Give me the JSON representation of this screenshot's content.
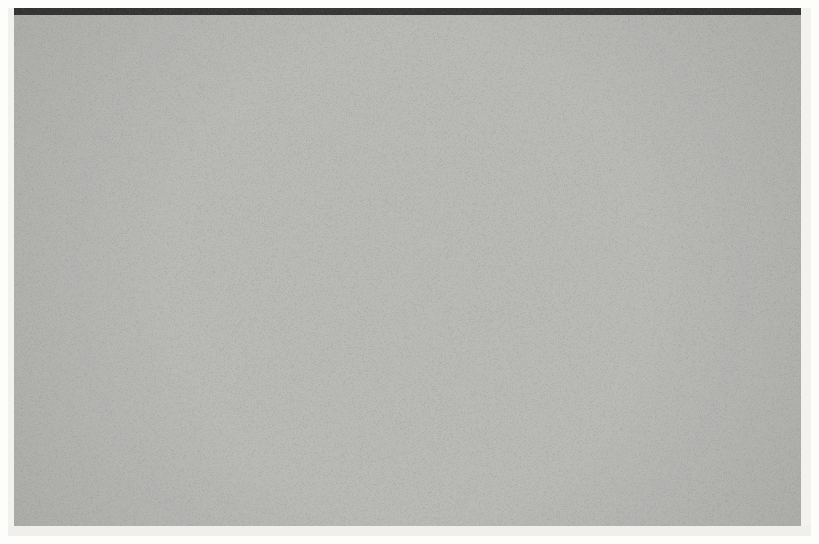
{
  "artwork": {
    "title": "Op-Art Modulated Grid",
    "style": "kinetic-optical-art",
    "medium_look": "halftone print scan",
    "canvas": {
      "width": 819,
      "height": 544
    },
    "plate": {
      "x": 8,
      "y": 8,
      "width": 803,
      "height": 528,
      "ground_color": "#b9b9b6",
      "paper_color": "#fdfdfc",
      "top_edge_color": "#2b2b2b"
    }
  },
  "grid": {
    "origin_x": 14,
    "origin_y": 14,
    "pitch_x": 19.0,
    "pitch_y": 19.0,
    "columns": 42,
    "rows": 27,
    "base_square_ratio": 0.7,
    "base_square_color": "#262626",
    "base_cell_color": "#b9b9b6",
    "square_corner_radius": 1
  },
  "modulations": [
    {
      "name": "bright-lens",
      "kind": "light-swell",
      "center_x": 146,
      "center_y": 164,
      "radius_x": 150,
      "radius_y": 135,
      "cell_color_peak": "#e9e8e3",
      "square_shrink_peak": 0.8,
      "square_color_peak": "#3a3a3a",
      "description": "squares contract toward a luminous core in the upper-left quadrant"
    },
    {
      "name": "dark-blob",
      "kind": "dark-swell",
      "center_x": 146,
      "center_y": 378,
      "radius_x": 135,
      "radius_y": 100,
      "cell_color_peak": "#141414",
      "square_grow_peak": 0.3,
      "square_color_peak": "#060606",
      "description": "squares expand and the ground darkens into a deep well in the lower-left quadrant"
    },
    {
      "name": "rhombus-wave-column",
      "kind": "shear-column",
      "center_x": 296,
      "half_width": 16,
      "max_skew_deg": 34,
      "description": "a single vertical column of cells sheared into rhombi, forming a rippling seam"
    }
  ],
  "circle_field": {
    "description": "six columns by six rows of circles replacing grid squares on the right half",
    "column_x": [
      372,
      448,
      524,
      600,
      676,
      752
    ],
    "rows": [
      {
        "y": 84,
        "diameter": 29,
        "color": "#1c1c1c",
        "cell_color": "#b3b3b0",
        "label": "row-1-large-dark"
      },
      {
        "y": 156,
        "diameter": 25,
        "color": "#242424",
        "cell_color": "#b5b5b2",
        "label": "row-2-dark"
      },
      {
        "y": 232,
        "diameter": 21,
        "color": "#2b2b2b",
        "cell_color": "#b7b7b4",
        "label": "row-3-medium"
      },
      {
        "y": 308,
        "diameter": 14,
        "color": "#343434",
        "cell_color": "#c6c6c2",
        "label": "row-4-small"
      },
      {
        "y": 385,
        "diameter": 9,
        "color": "#3b3b3b",
        "cell_color": "#d2d2cd",
        "label": "row-5-tiny-dark"
      },
      {
        "y": 462,
        "diameter": 8,
        "color": "#8f8f8c",
        "cell_color": "#e0e0db",
        "label": "row-6-tiny-light"
      }
    ]
  },
  "texture": {
    "halftone_streak_opacity": 0.16,
    "paper_grain_opacity": 0.07,
    "vignette_opacity": 0.1
  },
  "labels": {
    "root": "op-art-artwork",
    "plate": "print-plate",
    "canvas": "modulated-grid-canvas"
  }
}
